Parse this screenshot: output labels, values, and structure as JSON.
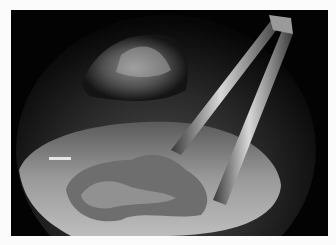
{
  "image": {
    "description": "Grayscale endoscopic surgical view showing grasping forceps manipulating tissue inside a circular field of view",
    "subject": "endoscopic surgery",
    "elements": [
      "forceps",
      "tissue",
      "fluid surface",
      "upper tissue wall"
    ]
  }
}
